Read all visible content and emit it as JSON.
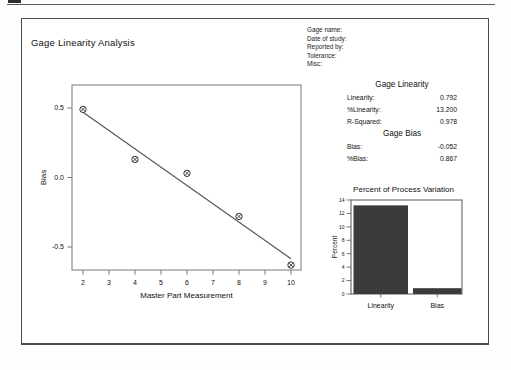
{
  "report": {
    "title": "Gage Linearity Analysis",
    "header_fields": [
      "Gage name:",
      "Date of study:",
      "Reported by:",
      "Tolerance:",
      "Misc:"
    ]
  },
  "stats": {
    "linearity_header": "Gage Linearity",
    "rows_linearity": [
      {
        "label": "Linearity:",
        "value": "0.792"
      },
      {
        "label": "%Linearity:",
        "value": "13.200"
      },
      {
        "label": "R-Squared:",
        "value": "0.978"
      }
    ],
    "bias_header": "Gage Bias",
    "rows_bias": [
      {
        "label": "Bias:",
        "value": "-0.052"
      },
      {
        "label": "%Bias:",
        "value": "0.867"
      }
    ]
  },
  "chart_data": [
    {
      "type": "scatter",
      "title": "",
      "xlabel": "Master Part Measurement",
      "ylabel": "Bias",
      "x_ticks": [
        2,
        3,
        4,
        5,
        6,
        7,
        8,
        9,
        10
      ],
      "y_ticks": [
        0.5,
        0.0,
        -0.5
      ],
      "xlim": [
        1.58,
        10.38
      ],
      "ylim": [
        -0.67,
        0.67
      ],
      "points": [
        [
          2,
          0.49
        ],
        [
          4,
          0.13
        ],
        [
          6,
          0.03
        ],
        [
          8,
          -0.28
        ],
        [
          10,
          -0.63
        ]
      ],
      "fit_line": {
        "intercept": 0.733,
        "slope": -0.1317,
        "x_start": 2,
        "x_end": 10
      },
      "marker": "circled-x",
      "grid": false
    },
    {
      "type": "bar",
      "title": "Percent of Process Variation",
      "xlabel": "",
      "ylabel": "Percent",
      "categories": [
        "Linearity",
        "Bias"
      ],
      "values": [
        13.2,
        0.867
      ],
      "y_ticks": [
        0,
        2,
        4,
        6,
        8,
        10,
        12,
        14
      ],
      "ylim": [
        0,
        14
      ],
      "bar_color": "#3b3b3b",
      "grid": false,
      "legend": "none"
    }
  ],
  "colors": {
    "frame_border": "#4c4c4c",
    "plot_frame": "#777777",
    "fit_line": "#555555",
    "text": "#111111"
  }
}
